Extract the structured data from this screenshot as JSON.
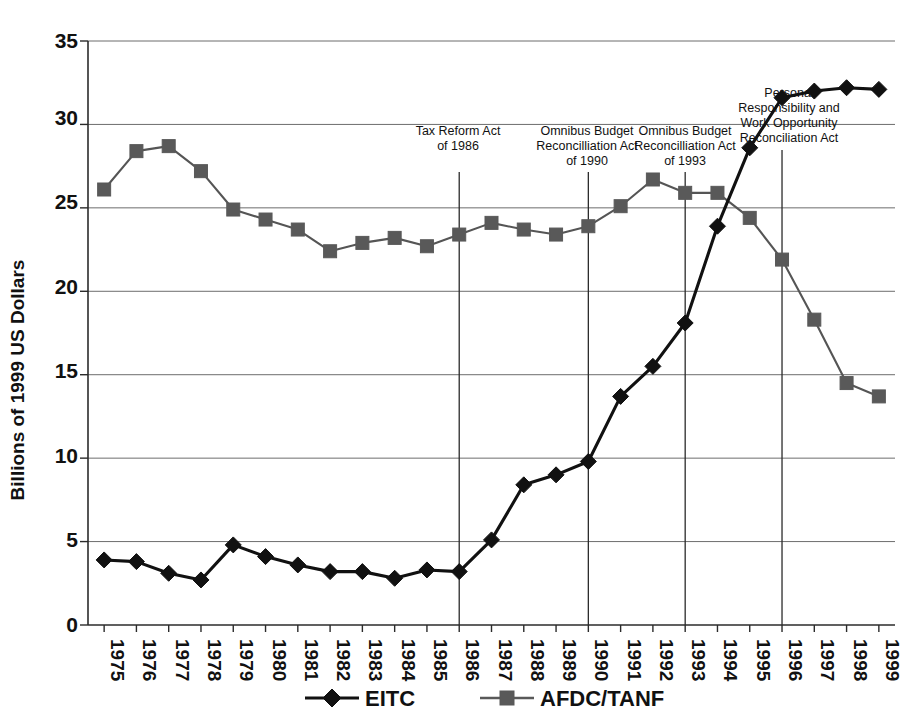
{
  "chart_data": {
    "type": "line",
    "title": "",
    "subtitle": "",
    "xlabel": "",
    "ylabel": "Billions of 1999 US Dollars",
    "ylim": [
      0,
      35
    ],
    "yticks": [
      0,
      5,
      10,
      15,
      20,
      25,
      30,
      35
    ],
    "grid": true,
    "legend_position": "bottom",
    "x": [
      1975,
      1976,
      1977,
      1978,
      1979,
      1980,
      1981,
      1982,
      1983,
      1984,
      1985,
      1986,
      1987,
      1988,
      1989,
      1990,
      1991,
      1992,
      1993,
      1994,
      1995,
      1996,
      1997,
      1998,
      1999
    ],
    "categories": [
      "1975",
      "1976",
      "1977",
      "1978",
      "1979",
      "1980",
      "1981",
      "1982",
      "1983",
      "1984",
      "1985",
      "1986",
      "1987",
      "1988",
      "1989",
      "1990",
      "1991",
      "1992",
      "1993",
      "1994",
      "1995",
      "1996",
      "1997",
      "1998",
      "1999"
    ],
    "series": [
      {
        "name": "EITC",
        "marker": "diamond",
        "color": "#111111",
        "values": [
          3.9,
          3.8,
          3.1,
          2.7,
          4.8,
          4.1,
          3.6,
          3.2,
          3.2,
          2.8,
          3.3,
          3.2,
          5.1,
          8.4,
          9.0,
          9.8,
          13.7,
          15.5,
          18.1,
          23.9,
          28.6,
          31.6,
          32.0,
          32.2,
          32.1
        ]
      },
      {
        "name": "AFDC/TANF",
        "marker": "square",
        "color": "#595959",
        "values": [
          26.1,
          28.4,
          28.7,
          27.2,
          24.9,
          24.3,
          23.7,
          22.4,
          22.9,
          23.2,
          22.7,
          23.4,
          24.1,
          23.7,
          23.4,
          23.9,
          25.1,
          26.7,
          25.9,
          25.9,
          24.4,
          21.9,
          18.3,
          14.5,
          13.7
        ]
      }
    ],
    "annotations": [
      {
        "label": "Tax Reform Act\nof 1986",
        "lines": [
          "Tax Reform Act",
          "of 1986"
        ],
        "at_year": 1986
      },
      {
        "label": "Omnibus Budget\nReconcilliation Act\nof 1990",
        "lines": [
          "Omnibus Budget",
          "Reconcilliation Act",
          "of 1990"
        ],
        "at_year": 1990
      },
      {
        "label": "Omnibus Budget\nReconcilliation Act\nof 1993",
        "lines": [
          "Omnibus Budget",
          "Reconcilliation Act",
          "of 1993"
        ],
        "at_year": 1993
      },
      {
        "label": "Personal\nResponsibility and\nWork Opportunity\nReconciliation Act",
        "lines": [
          "Personal",
          "Responsibility and",
          "Work Opportunity",
          "Reconciliation Act"
        ],
        "at_year": 1996
      }
    ]
  },
  "yticks": {
    "t0": "0",
    "t1": "5",
    "t2": "10",
    "t3": "15",
    "t4": "20",
    "t5": "25",
    "t6": "30",
    "t7": "35"
  },
  "axis": {
    "ylabel": "Billions of 1999 US Dollars"
  },
  "legend": {
    "items": [
      {
        "label": "EITC",
        "marker": "diamond",
        "color": "#111111"
      },
      {
        "label": "AFDC/TANF",
        "marker": "square",
        "color": "#595959"
      }
    ],
    "item0": "EITC",
    "item1": "AFDC/TANF"
  },
  "annotation_text": {
    "a0l0": "Tax Reform Act",
    "a0l1": "of 1986",
    "a1l0": "Omnibus Budget",
    "a1l1": "Reconcilliation Act",
    "a1l2": "of 1990",
    "a2l0": "Omnibus Budget",
    "a2l1": "Reconcilliation Act",
    "a2l2": "of 1993",
    "a3l0": "Personal",
    "a3l1": "Responsibility and",
    "a3l2": "Work Opportunity",
    "a3l3": "Reconciliation Act"
  },
  "xlabels": {
    "x0": "1975",
    "x1": "1976",
    "x2": "1977",
    "x3": "1978",
    "x4": "1979",
    "x5": "1980",
    "x6": "1981",
    "x7": "1982",
    "x8": "1983",
    "x9": "1984",
    "x10": "1985",
    "x11": "1986",
    "x12": "1987",
    "x13": "1988",
    "x14": "1989",
    "x15": "1990",
    "x16": "1991",
    "x17": "1992",
    "x18": "1993",
    "x19": "1994",
    "x20": "1995",
    "x21": "1996",
    "x22": "1997",
    "x23": "1998",
    "x24": "1999"
  },
  "colors": {
    "eitc": "#111111",
    "afdc": "#595959",
    "grid": "#6d6d6d",
    "axis": "#2b2b2b",
    "background": "#ffffff"
  }
}
